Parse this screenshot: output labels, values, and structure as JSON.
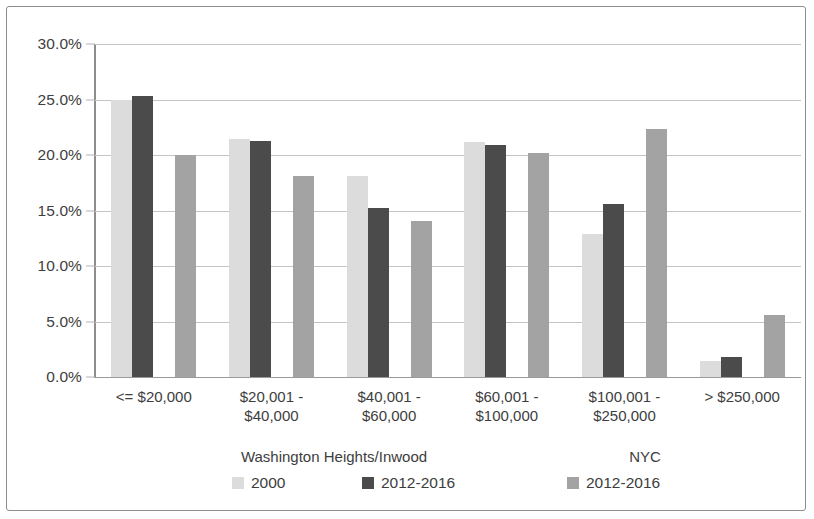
{
  "chart_data": {
    "type": "bar",
    "title": "",
    "xlabel": "",
    "ylabel": "",
    "ylim": [
      0,
      30
    ],
    "ytick_labels": [
      "0.0%",
      "5.0%",
      "10.0%",
      "15.0%",
      "20.0%",
      "25.0%",
      "30.0%"
    ],
    "ytick_values": [
      0,
      5,
      10,
      15,
      20,
      25,
      30
    ],
    "grid": true,
    "legend_position": "bottom",
    "categories": [
      "<= $20,000",
      "$20,001 -\n$40,000",
      "$40,001 -\n$60,000",
      "$60,001 -\n$100,000",
      "$100,001 -\n$250,000",
      "> $250,000"
    ],
    "series": [
      {
        "name": "2000",
        "group": "Washington Heights/Inwood",
        "color": "#dcdcdc",
        "values": [
          25.0,
          21.4,
          18.1,
          21.2,
          12.9,
          1.4
        ]
      },
      {
        "name": "2012-2016",
        "group": "Washington Heights/Inwood",
        "color": "#4b4b4b",
        "values": [
          25.3,
          21.3,
          15.2,
          20.9,
          15.6,
          1.8
        ]
      },
      {
        "name": "2012-2016",
        "group": "NYC",
        "color": "#a3a3a3",
        "values": [
          20.0,
          18.1,
          14.1,
          20.2,
          22.3,
          5.6
        ]
      }
    ]
  },
  "legend": {
    "group_titles": [
      "Washington Heights/Inwood",
      "NYC"
    ],
    "entries": [
      {
        "label": "2000",
        "color": "#dcdcdc"
      },
      {
        "label": "2012-2016",
        "color": "#4b4b4b"
      },
      {
        "label": "2012-2016",
        "color": "#a3a3a3"
      }
    ]
  }
}
